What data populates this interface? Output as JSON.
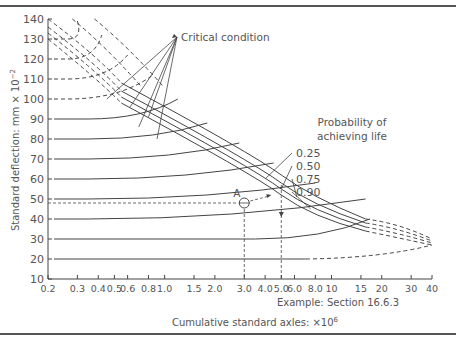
{
  "chart_data": {
    "type": "line",
    "title": "",
    "xlabel": "Cumulative standard axles: ×10^6",
    "xlabel_main": "Cumulative standard axles: ×10",
    "xlabel_sup": "6",
    "ylabel": "Standard deflection: mm × 10^-2",
    "ylabel_main": "Standard deflection: mm × 10",
    "ylabel_sup": "−2",
    "xscale": "log",
    "xlim": [
      0.2,
      40
    ],
    "ylim": [
      10,
      140
    ],
    "x_ticks": [
      "0.2",
      "0.3",
      "0.4",
      "0.5",
      "0.6",
      "0.8",
      "1.0",
      "1.5",
      "2.0",
      "3.0",
      "4.0",
      "5.0",
      "6.0",
      "8.0",
      "10",
      "15",
      "20",
      "30",
      "40"
    ],
    "y_ticks": [
      "10",
      "20",
      "30",
      "40",
      "50",
      "60",
      "70",
      "80",
      "90",
      "100",
      "110",
      "120",
      "130",
      "140"
    ],
    "grid": false,
    "annotations": {
      "critical": "Critical condition",
      "probability_title_1": "Probability of",
      "probability_title_2": "achieving life",
      "example": "Example: Section 16.6.3",
      "point_label": "A"
    },
    "legend": {
      "position": "right-inside",
      "entries": [
        "0.25",
        "0.50",
        "0.75",
        "0.90"
      ]
    },
    "series": [
      {
        "name": "0.25",
        "description": "probability curve, deflection vs life",
        "x": [
          0.2,
          1.0,
          5.0,
          16,
          40
        ],
        "y": [
          140,
          98,
          62,
          40,
          30
        ]
      },
      {
        "name": "0.50",
        "x": [
          0.2,
          1.0,
          5.0,
          16,
          40
        ],
        "y": [
          136,
          93,
          58,
          38,
          29
        ]
      },
      {
        "name": "0.75",
        "x": [
          0.2,
          1.0,
          5.0,
          16,
          40
        ],
        "y": [
          133,
          89,
          55,
          36,
          28
        ]
      },
      {
        "name": "0.90",
        "x": [
          0.2,
          1.0,
          5.0,
          16,
          40
        ],
        "y": [
          130,
          85,
          52,
          34,
          27
        ]
      }
    ],
    "baselines": [
      20,
      30,
      40,
      50,
      60,
      70,
      80,
      90,
      100,
      110,
      120,
      130
    ],
    "example_point": {
      "label": "A",
      "x": 3.0,
      "y": 48,
      "projected_life": 5.0
    }
  }
}
